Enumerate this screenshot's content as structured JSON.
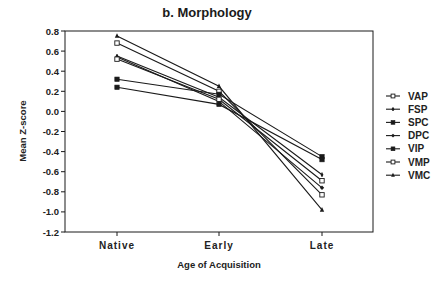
{
  "chart_data": {
    "type": "line",
    "title": "b.  Morphology",
    "xlabel": "Age of Acquisition",
    "ylabel": "Mean Z-score",
    "categories": [
      "Native",
      "Early",
      "Late"
    ],
    "ylim": [
      -1.2,
      0.8
    ],
    "yticks": [
      0.8,
      0.6,
      0.4,
      0.2,
      0.0,
      -0.2,
      -0.4,
      -0.6,
      -0.8,
      -1.0,
      -1.2
    ],
    "ytick_labels": [
      "0.8",
      "0.6",
      "0.4",
      "0.2",
      "0.0",
      "-0.2",
      "-0.4",
      "-0.6",
      "-0.8",
      "-1.0",
      "-1.2"
    ],
    "grid": false,
    "legend_position": "right",
    "series": [
      {
        "name": "VAP",
        "marker": "open-square",
        "values": [
          0.68,
          0.2,
          -0.83
        ]
      },
      {
        "name": "FSP",
        "marker": "plus",
        "values": [
          0.55,
          0.14,
          -0.63
        ]
      },
      {
        "name": "SPC",
        "marker": "filled-square",
        "values": [
          0.32,
          0.17,
          -0.45
        ]
      },
      {
        "name": "DPC",
        "marker": "diamond",
        "values": [
          0.54,
          0.1,
          -0.76
        ]
      },
      {
        "name": "VIP",
        "marker": "filled-square",
        "values": [
          0.24,
          0.07,
          -0.48
        ]
      },
      {
        "name": "VMP",
        "marker": "open-square",
        "values": [
          0.52,
          0.12,
          -0.69
        ]
      },
      {
        "name": "VMC",
        "marker": "triangle",
        "values": [
          0.75,
          0.25,
          -0.98
        ]
      }
    ]
  },
  "colors": {
    "line": "#1a1a1a",
    "background": "#ffffff"
  }
}
